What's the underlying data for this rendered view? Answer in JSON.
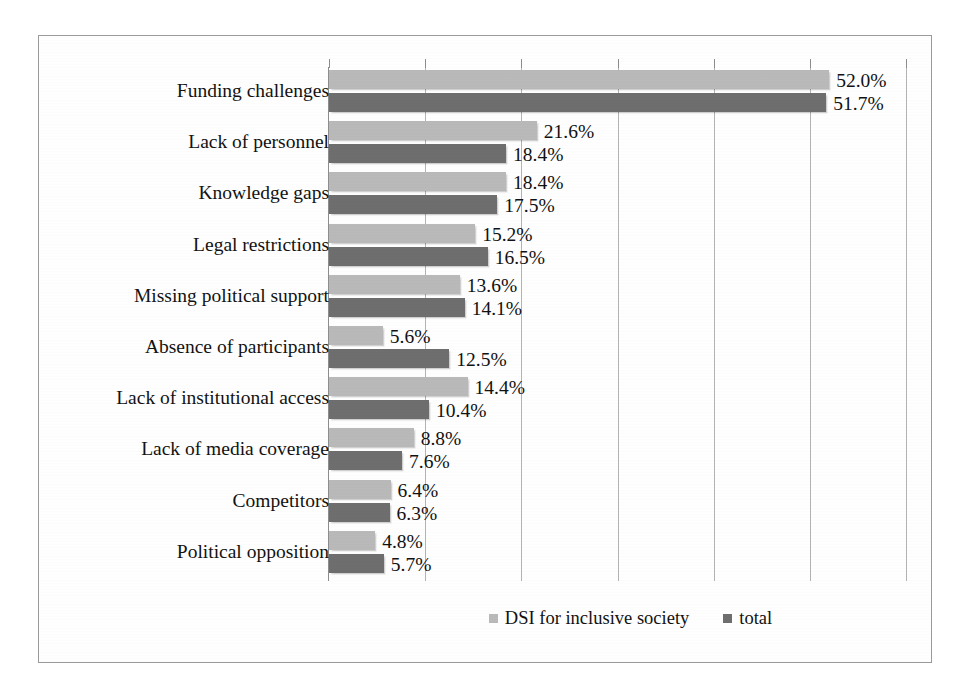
{
  "chart_data": {
    "type": "bar",
    "orientation": "horizontal",
    "title": "",
    "xlabel": "",
    "ylabel": "",
    "xlim": [
      0,
      60
    ],
    "grid": true,
    "grid_axis": "x",
    "gridline_values": [
      10,
      20,
      30,
      40,
      50,
      60
    ],
    "legend_position": "bottom",
    "categories": [
      "Funding challenges",
      "Lack of personnel",
      "Knowledge gaps",
      "Legal restrictions",
      "Missing political support",
      "Absence of participants",
      "Lack of institutional access",
      "Lack of media coverage",
      "Competitors",
      "Political opposition"
    ],
    "series": [
      {
        "name": "DSI for inclusive society",
        "color": "#b9b9b9",
        "values": [
          52.0,
          21.6,
          18.4,
          15.2,
          13.6,
          5.6,
          14.4,
          8.8,
          6.4,
          4.8
        ],
        "labels": [
          "52.0%",
          "21.6%",
          "18.4%",
          "15.2%",
          "13.6%",
          "5.6%",
          "14.4%",
          "8.8%",
          "6.4%",
          "4.8%"
        ]
      },
      {
        "name": "total",
        "color": "#6e6e6e",
        "values": [
          51.7,
          18.4,
          17.5,
          16.5,
          14.1,
          12.5,
          10.4,
          7.6,
          6.3,
          5.7
        ],
        "labels": [
          "51.7%",
          "18.4%",
          "17.5%",
          "16.5%",
          "14.1%",
          "12.5%",
          "10.4%",
          "7.6%",
          "6.3%",
          "5.7%"
        ]
      }
    ]
  },
  "legend": {
    "items": [
      {
        "label": "DSI for inclusive society",
        "swatch": "s1"
      },
      {
        "label": "total",
        "swatch": "s2"
      }
    ]
  }
}
